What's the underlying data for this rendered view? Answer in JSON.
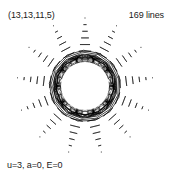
{
  "figure": {
    "params_label": "(13,13,11,5)",
    "line_count_label": "169 lines",
    "equation_label": "u=3, a=0, E=0",
    "background_color": "#ffffff",
    "stroke_color": "#000000"
  },
  "chart_data": {
    "type": "line",
    "title": "(13,13,11,5)",
    "subtitle": "169 lines",
    "annotations": [
      "(13,13,11,5)",
      "169 lines",
      "u=3, a=0, E=0"
    ],
    "figure_kind": "string-art-rosette",
    "parameters": {
      "n_points": 13,
      "n_rings": 13,
      "p": 11,
      "q": 5,
      "u": 3,
      "a": 0,
      "E": 0,
      "total_lines": 169
    },
    "geometry": {
      "center_x": 85,
      "center_y": 86,
      "outer_radius": 68,
      "inner_radius": 29,
      "hole_radius": 24,
      "spike_count": 13,
      "rotation_deg": -90
    },
    "axes": {
      "grid": false,
      "xlabel": "",
      "ylabel": "",
      "xlim": [
        0,
        169
      ],
      "ylim": [
        0,
        178
      ]
    },
    "legend": {
      "show": false,
      "position": "none",
      "entries": []
    },
    "series": [
      {
        "name": "chords",
        "stroke": "#000000",
        "count": 169
      }
    ]
  }
}
